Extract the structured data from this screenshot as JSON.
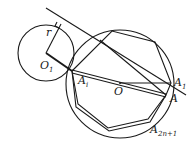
{
  "diagram": {
    "labels": {
      "r": "r",
      "O1": "O",
      "O1_sub": "1",
      "Ai": "A",
      "Ai_sub": "i",
      "O": "O",
      "A1": "A",
      "A1_sub": "1",
      "A": "A",
      "A2n1": "A",
      "A2n1_sub": "2n+1"
    },
    "colors": {
      "stroke": "#1a1a1a",
      "background": "#ffffff"
    }
  }
}
